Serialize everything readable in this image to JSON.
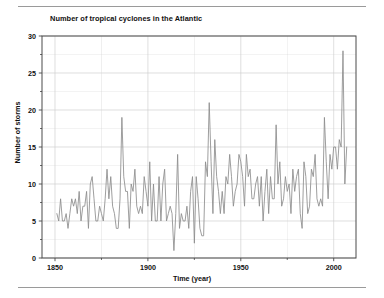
{
  "figure": {
    "title": "Number of tropical cyclones in the Atlantic",
    "top_rule": "horizontal-rule",
    "bottom_rule": "horizontal-rule"
  },
  "axes": {
    "xlabel": "Time (year)",
    "ylabel": "Number of storms",
    "y_ticks": [
      "0",
      "5",
      "10",
      "15",
      "20",
      "25",
      "30"
    ],
    "x_ticks": [
      "1850",
      "1900",
      "1950",
      "2000"
    ]
  },
  "colors": {
    "line": "#8d8d8d",
    "grid": "#d0d0d0",
    "axis": "#4a4a4a",
    "text": "#111111",
    "background": "#ffffff"
  },
  "chart_data": {
    "type": "line",
    "title": "Number of tropical cyclones in the Atlantic",
    "xlabel": "Time (year)",
    "ylabel": "Number of storms",
    "xlim": [
      1843,
      2012
    ],
    "ylim": [
      0,
      30
    ],
    "grid": true,
    "legend": "none",
    "y_major_ticks": [
      0,
      5,
      10,
      15,
      20,
      25,
      30
    ],
    "y_minor_step": 2.5,
    "x_major_ticks": [
      1850,
      1900,
      1950,
      2000
    ],
    "x_minor_step": 25,
    "series": [
      {
        "name": "Number of storms",
        "color": "#8d8d8d",
        "x": [
          1851,
          1852,
          1853,
          1854,
          1855,
          1856,
          1857,
          1858,
          1859,
          1860,
          1861,
          1862,
          1863,
          1864,
          1865,
          1866,
          1867,
          1868,
          1869,
          1870,
          1871,
          1872,
          1873,
          1874,
          1875,
          1876,
          1877,
          1878,
          1879,
          1880,
          1881,
          1882,
          1883,
          1884,
          1885,
          1886,
          1887,
          1888,
          1889,
          1890,
          1891,
          1892,
          1893,
          1894,
          1895,
          1896,
          1897,
          1898,
          1899,
          1900,
          1901,
          1902,
          1903,
          1904,
          1905,
          1906,
          1907,
          1908,
          1909,
          1910,
          1911,
          1912,
          1913,
          1914,
          1915,
          1916,
          1917,
          1918,
          1919,
          1920,
          1921,
          1922,
          1923,
          1924,
          1925,
          1926,
          1927,
          1928,
          1929,
          1930,
          1931,
          1932,
          1933,
          1934,
          1935,
          1936,
          1937,
          1938,
          1939,
          1940,
          1941,
          1942,
          1943,
          1944,
          1945,
          1946,
          1947,
          1948,
          1949,
          1950,
          1951,
          1952,
          1953,
          1954,
          1955,
          1956,
          1957,
          1958,
          1959,
          1960,
          1961,
          1962,
          1963,
          1964,
          1965,
          1966,
          1967,
          1968,
          1969,
          1970,
          1971,
          1972,
          1973,
          1974,
          1975,
          1976,
          1977,
          1978,
          1979,
          1980,
          1981,
          1982,
          1983,
          1984,
          1985,
          1986,
          1987,
          1988,
          1989,
          1990,
          1991,
          1992,
          1993,
          1994,
          1995,
          1996,
          1997,
          1998,
          1999,
          2000,
          2001,
          2002,
          2003,
          2004,
          2005,
          2006,
          2007
        ],
        "values": [
          6,
          5,
          8,
          5,
          5,
          6,
          4,
          6,
          8,
          7,
          8,
          6,
          9,
          5,
          7,
          7,
          9,
          4,
          10,
          11,
          8,
          5,
          5,
          7,
          6,
          5,
          8,
          12,
          8,
          11,
          7,
          6,
          4,
          4,
          8,
          19,
          11,
          9,
          9,
          4,
          10,
          9,
          12,
          7,
          6,
          7,
          6,
          11,
          9,
          7,
          13,
          5,
          10,
          5,
          5,
          11,
          5,
          10,
          12,
          5,
          6,
          7,
          6,
          1,
          6,
          14,
          4,
          6,
          5,
          5,
          7,
          4,
          9,
          11,
          2,
          11,
          8,
          4,
          3,
          3,
          13,
          11,
          21,
          13,
          6,
          16,
          11,
          9,
          6,
          9,
          6,
          11,
          10,
          14,
          11,
          7,
          9,
          10,
          14,
          13,
          11,
          7,
          14,
          11,
          12,
          8,
          8,
          10,
          11,
          7,
          11,
          5,
          9,
          12,
          6,
          11,
          8,
          8,
          18,
          10,
          13,
          7,
          8,
          11,
          9,
          10,
          6,
          12,
          9,
          11,
          12,
          6,
          4,
          13,
          11,
          6,
          7,
          12,
          11,
          14,
          8,
          7,
          8,
          7,
          19,
          13,
          8,
          14,
          12,
          15,
          15,
          12,
          16,
          15,
          28,
          10,
          15
        ]
      }
    ]
  }
}
